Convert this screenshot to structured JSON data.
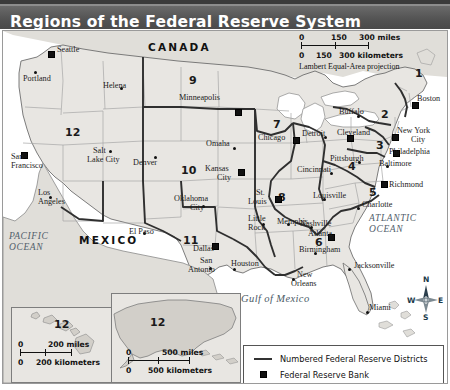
{
  "title": "Regions of the Federal Reserve System",
  "map": {
    "countries": [
      {
        "name": "CANADA",
        "x": 145,
        "y": 12
      },
      {
        "name": "MEXICO",
        "x": 76,
        "y": 205
      }
    ],
    "oceans": [
      {
        "name": "PACIFIC\nOCEAN",
        "line1": "PACIFIC",
        "line2": "OCEAN",
        "x": 6,
        "y": 203
      },
      {
        "name": "ATLANTIC\nOCEAN",
        "line1": "ATLANTIC",
        "line2": "OCEAN",
        "x": 366,
        "y": 184
      },
      {
        "name": "Gulf of Mexico",
        "x": 238,
        "y": 263
      }
    ],
    "districts": [
      {
        "number": "1",
        "x": 412,
        "y": 38
      },
      {
        "number": "2",
        "x": 378,
        "y": 79
      },
      {
        "number": "3",
        "x": 373,
        "y": 110
      },
      {
        "number": "4",
        "x": 345,
        "y": 131
      },
      {
        "number": "5",
        "x": 366,
        "y": 157
      },
      {
        "number": "6",
        "x": 312,
        "y": 207
      },
      {
        "number": "7",
        "x": 270,
        "y": 89
      },
      {
        "number": "8",
        "x": 275,
        "y": 162
      },
      {
        "number": "9",
        "x": 186,
        "y": 45
      },
      {
        "number": "10",
        "x": 178,
        "y": 135
      },
      {
        "number": "11",
        "x": 180,
        "y": 205
      },
      {
        "number": "12",
        "x": 62,
        "y": 97
      },
      {
        "number": "12-alaska",
        "label": "12",
        "x": 54,
        "y": 22
      },
      {
        "number": "12-hawaii",
        "label": "12",
        "x": 42,
        "y": 12
      }
    ],
    "reserve_banks": [
      {
        "name": "Seattle",
        "x": 45,
        "y": 20,
        "lx": 54,
        "ly": 16
      },
      {
        "name": "San Francisco",
        "x": 18,
        "y": 121,
        "lx": 8,
        "ly": 124,
        "two": true
      },
      {
        "name": "Minneapolis",
        "x": 232,
        "y": 78,
        "lx": 176,
        "ly": 64
      },
      {
        "name": "Kansas City",
        "x": 235,
        "y": 138,
        "lx": 204,
        "ly": 136,
        "two": true
      },
      {
        "name": "Dallas",
        "x": 209,
        "y": 212,
        "lx": 195,
        "ly": 208
      },
      {
        "name": "Chicago",
        "x": 290,
        "y": 106,
        "lx": 255,
        "ly": 104
      },
      {
        "name": "St. Louis",
        "x": 272,
        "y": 165,
        "lx": 243,
        "ly": 158,
        "two": true
      },
      {
        "name": "Atlanta",
        "x": 325,
        "y": 203,
        "lx": 304,
        "ly": 198
      },
      {
        "name": "Cleveland",
        "x": 340,
        "y": 102,
        "lx": 340,
        "ly": 100
      },
      {
        "name": "Richmond",
        "x": 377,
        "y": 150,
        "lx": 385,
        "ly": 150
      },
      {
        "name": "Philadelphia",
        "x": 390,
        "y": 119,
        "lx": 385,
        "ly": 118
      },
      {
        "name": "New York City",
        "x": 389,
        "y": 103,
        "lx": 390,
        "ly": 98,
        "two": true
      },
      {
        "name": "Boston",
        "x": 410,
        "y": 70,
        "lx": 414,
        "ly": 62
      }
    ],
    "branch_banks": [
      {
        "name": "Portland",
        "x": 31,
        "y": 40,
        "lx": 23,
        "ly": 44
      },
      {
        "name": "Helena",
        "x": 117,
        "y": 55,
        "lx": 100,
        "ly": 52
      },
      {
        "name": "Salt Lake City",
        "x": 106,
        "y": 119,
        "lx": 86,
        "ly": 118,
        "two": true
      },
      {
        "name": "Denver",
        "x": 151,
        "y": 125,
        "lx": 132,
        "ly": 125
      },
      {
        "name": "Los Angeles",
        "x": 46,
        "y": 163,
        "lx": 36,
        "ly": 160,
        "two": true
      },
      {
        "name": "El Paso",
        "x": 138,
        "y": 199,
        "lx": 132,
        "ly": 196
      },
      {
        "name": "Oklahoma City",
        "x": 199,
        "y": 172,
        "lx": 172,
        "ly": 165,
        "two": true
      },
      {
        "name": "San Antonio",
        "x": 206,
        "y": 234,
        "lx": 186,
        "ly": 229,
        "two": true
      },
      {
        "name": "Houston",
        "x": 230,
        "y": 235,
        "lx": 233,
        "ly": 230
      },
      {
        "name": "Omaha",
        "x": 230,
        "y": 115,
        "lx": 205,
        "ly": 109
      },
      {
        "name": "Little Rock",
        "x": 258,
        "y": 190,
        "lx": 246,
        "ly": 186,
        "two": true
      },
      {
        "name": "Memphis",
        "x": 284,
        "y": 190,
        "lx": 281,
        "ly": 186
      },
      {
        "name": "New Orleans",
        "x": 290,
        "y": 245,
        "lx": 288,
        "ly": 240,
        "two": true
      },
      {
        "name": "Birmingham",
        "x": 310,
        "y": 219,
        "lx": 300,
        "ly": 215
      },
      {
        "name": "Nashville",
        "x": 306,
        "y": 193,
        "lx": 300,
        "ly": 188
      },
      {
        "name": "Jacksonville",
        "x": 345,
        "y": 235,
        "lx": 352,
        "ly": 231
      },
      {
        "name": "Miami",
        "x": 367,
        "y": 278,
        "lx": 370,
        "ly": 275
      },
      {
        "name": "Charlotte",
        "x": 354,
        "y": 175,
        "lx": 358,
        "ly": 172
      },
      {
        "name": "Louisville",
        "x": 320,
        "y": 165,
        "lx": 313,
        "ly": 162
      },
      {
        "name": "Cincinnati",
        "x": 327,
        "y": 139,
        "lx": 301,
        "ly": 134
      },
      {
        "name": "Pittsburgh",
        "x": 355,
        "y": 128,
        "lx": 333,
        "ly": 124
      },
      {
        "name": "Detroit",
        "x": 321,
        "y": 103,
        "lx": 305,
        "ly": 100
      },
      {
        "name": "Buffalo",
        "x": 354,
        "y": 83,
        "lx": 341,
        "ly": 78
      },
      {
        "name": "Baltimore",
        "x": 383,
        "y": 133,
        "lx": 379,
        "ly": 130
      }
    ]
  },
  "scale_main": {
    "miles_zero": "0",
    "miles_mid": "150",
    "miles_max": "300 miles",
    "km_zero": "0",
    "km_mid": "150",
    "km_max": "300 kilometers",
    "projection": "Lambert Equal-Area projection"
  },
  "scale_hawaii": {
    "miles_zero": "0",
    "miles_max": "200 miles",
    "km_zero": "0",
    "km_max": "200 kilometers"
  },
  "scale_alaska": {
    "miles_zero": "0",
    "miles_max": "500 miles",
    "km_zero": "0",
    "km_max": "500 kilometers"
  },
  "compass": {
    "north": "N",
    "south": "S",
    "east": "E",
    "west": "W"
  },
  "legend": {
    "items": [
      {
        "symbol": "line",
        "label": "Numbered Federal Reserve Districts"
      },
      {
        "symbol": "square",
        "label": "Federal Reserve Bank"
      },
      {
        "symbol": "dot",
        "label": "Federal Reserve Branch Bank"
      }
    ]
  },
  "colors": {
    "title_bar": "#595959",
    "map_land": "#e8e6e2",
    "map_water": "#ffffff",
    "district_line": "#3a3a3a",
    "state_line": "#9b9b9b"
  }
}
